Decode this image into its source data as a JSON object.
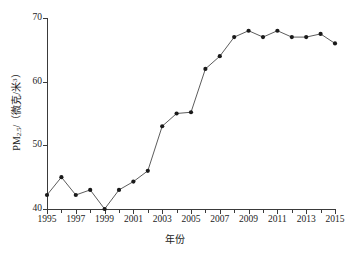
{
  "chart_data": {
    "type": "line",
    "title": "",
    "xlabel": "年份",
    "ylabel": "PM2.5/（微克/米³）",
    "ylabel_parts": {
      "prefix": "PM",
      "subscript": "2.5",
      "suffix": "/（微克/米",
      "superscript": "3",
      "tail": "）"
    },
    "x": [
      1995,
      1996,
      1997,
      1998,
      1999,
      2000,
      2001,
      2002,
      2003,
      2004,
      2005,
      2006,
      2007,
      2008,
      2009,
      2010,
      2011,
      2012,
      2013,
      2014,
      2015
    ],
    "values": [
      42.2,
      45.0,
      42.2,
      43.0,
      40.0,
      43.0,
      44.3,
      46.0,
      53.0,
      55.0,
      55.2,
      62.0,
      64.0,
      67.0,
      68.0,
      67.0,
      68.0,
      67.0,
      67.0,
      67.5,
      66.0
    ],
    "series": [
      {
        "name": "PM2.5",
        "values": [
          42.2,
          45.0,
          42.2,
          43.0,
          40.0,
          43.0,
          44.3,
          46.0,
          53.0,
          55.0,
          55.2,
          62.0,
          64.0,
          67.0,
          68.0,
          67.0,
          68.0,
          67.0,
          67.0,
          67.5,
          66.0
        ]
      }
    ],
    "xlim": [
      1995,
      2015
    ],
    "ylim": [
      40,
      70
    ],
    "ytick_labels": [
      "40",
      "50",
      "60",
      "70"
    ],
    "yticks": [
      40,
      50,
      60,
      70
    ],
    "xtick_labels": [
      "1995",
      "1997",
      "1999",
      "2001",
      "2003",
      "2005",
      "2007",
      "2009",
      "2011",
      "2013",
      "2015"
    ],
    "xticks": [
      1995,
      1997,
      1999,
      2001,
      2003,
      2005,
      2007,
      2009,
      2011,
      2013,
      2015
    ],
    "xticks_minor": [
      1996,
      1998,
      2000,
      2002,
      2004,
      2006,
      2008,
      2010,
      2012,
      2014
    ],
    "grid": false,
    "legend": false,
    "legend_position": "none",
    "line_color": "#4a4a4a",
    "marker_color": "#1a1a1a",
    "marker_shape": "circle",
    "axis_color": "#3a3a3a",
    "background_color": "#ffffff"
  }
}
